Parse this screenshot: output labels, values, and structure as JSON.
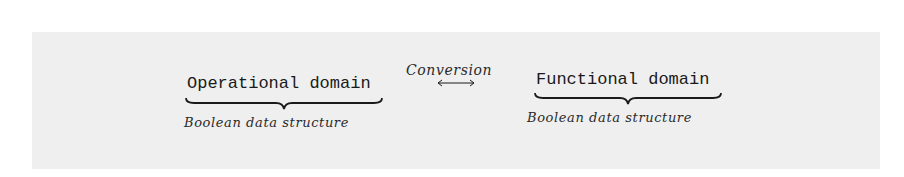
{
  "diagram": {
    "left": {
      "title": "Operational domain",
      "subtitle": "Boolean data structure"
    },
    "connector": {
      "label": "Conversion",
      "arrow": "left-right-arrow"
    },
    "right": {
      "title": "Functional domain",
      "subtitle": "Boolean data structure"
    }
  },
  "colors": {
    "background": "#efefef",
    "text": "#1a1a1a"
  }
}
